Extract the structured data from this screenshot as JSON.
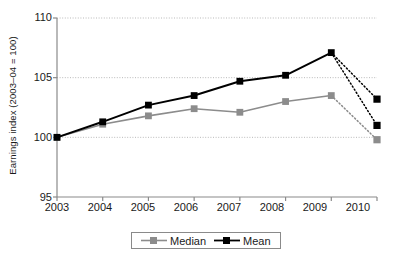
{
  "chart_data": {
    "type": "line",
    "title": "",
    "xlabel": "",
    "ylabel": "Earnings index (2003–04 = 100)",
    "categories": [
      "2003",
      "2004",
      "2005",
      "2006",
      "2007",
      "2008",
      "2009",
      "2010"
    ],
    "x": [
      2003,
      2004,
      2005,
      2006,
      2007,
      2008,
      2009,
      2010
    ],
    "xlim": [
      2003,
      2010
    ],
    "ylim": [
      95,
      110
    ],
    "yticks": [
      95,
      100,
      105,
      110
    ],
    "ytick_labels": [
      "95",
      "100",
      "105",
      "110"
    ],
    "xticks": [
      2003,
      2004,
      2005,
      2006,
      2007,
      2008,
      2009,
      2010
    ],
    "grid": "horizontal-dotted-at-100-105-110",
    "legend_position": "bottom-center",
    "series": [
      {
        "name": "Median",
        "color": "#8c8c8c",
        "marker": "square",
        "linestyle": "solid",
        "x": [
          2003,
          2004,
          2005,
          2006,
          2007,
          2008,
          2009
        ],
        "values": [
          100.0,
          101.1,
          101.8,
          102.4,
          102.1,
          103.0,
          103.5
        ]
      },
      {
        "name": "Mean",
        "color": "#000000",
        "marker": "square",
        "linestyle": "solid",
        "x": [
          2003,
          2004,
          2005,
          2006,
          2007,
          2008,
          2009
        ],
        "values": [
          100.0,
          101.3,
          102.7,
          103.5,
          104.7,
          105.2,
          107.1
        ]
      }
    ],
    "projections": [
      {
        "name": "Mean projection high",
        "color": "#000000",
        "linestyle": "dotted",
        "x": [
          2009,
          2010
        ],
        "values": [
          107.1,
          103.2
        ]
      },
      {
        "name": "Mean projection low",
        "color": "#000000",
        "linestyle": "dotted",
        "x": [
          2009,
          2010
        ],
        "values": [
          107.1,
          101.0
        ]
      },
      {
        "name": "Median projection",
        "color": "#8c8c8c",
        "linestyle": "dotted",
        "x": [
          2009,
          2010
        ],
        "values": [
          103.5,
          99.8
        ]
      }
    ]
  },
  "axis": {
    "ylabel": "Earnings index (2003–04 = 100)",
    "ytick_0": "95",
    "ytick_1": "100",
    "ytick_2": "105",
    "ytick_3": "110",
    "xtick_0": "2003",
    "xtick_1": "2004",
    "xtick_2": "2005",
    "xtick_3": "2006",
    "xtick_4": "2007",
    "xtick_5": "2008",
    "xtick_6": "2009",
    "xtick_7": "2010"
  },
  "legend": {
    "items": [
      {
        "label": "Median",
        "color": "#8c8c8c"
      },
      {
        "label": "Mean",
        "color": "#000000"
      }
    ]
  },
  "colors": {
    "median": "#8c8c8c",
    "mean": "#000000",
    "axis": "#8a8a8a",
    "grid": "#b9b9b9",
    "text": "#1a1a1a"
  }
}
